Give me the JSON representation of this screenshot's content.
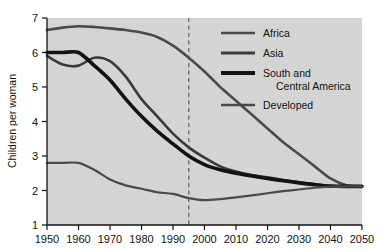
{
  "chart_data": {
    "type": "line",
    "title": "",
    "subtitle": "",
    "xlabel": "",
    "ylabel": "Children per woman",
    "xlim": [
      1950,
      2050
    ],
    "ylim": [
      1,
      7
    ],
    "xticks": [
      1950,
      1960,
      1970,
      1980,
      1990,
      2000,
      2010,
      2020,
      2030,
      2040,
      2050
    ],
    "yticks": [
      1,
      2,
      3,
      4,
      5,
      6,
      7
    ],
    "grid": false,
    "legend_position": "top-right",
    "plot_background": "#d5d5d5",
    "annotations": [
      {
        "name": "present-day-divider",
        "type": "vline",
        "x": 1995,
        "style": "dashed",
        "color": "#707070",
        "label": ""
      }
    ],
    "series": [
      {
        "name": "Africa",
        "color": "#4a4a4a",
        "line_width": 2.6,
        "x": [
          1950,
          1955,
          1960,
          1965,
          1970,
          1975,
          1980,
          1985,
          1990,
          1995,
          2000,
          2005,
          2010,
          2015,
          2020,
          2025,
          2030,
          2035,
          2040,
          2045,
          2050
        ],
        "values": [
          6.65,
          6.72,
          6.76,
          6.74,
          6.7,
          6.65,
          6.58,
          6.45,
          6.2,
          5.85,
          5.45,
          5.0,
          4.6,
          4.2,
          3.8,
          3.4,
          3.05,
          2.7,
          2.35,
          2.15,
          2.12
        ]
      },
      {
        "name": "Asia",
        "color": "#3a3a3a",
        "line_width": 2.6,
        "x": [
          1950,
          1955,
          1960,
          1965,
          1970,
          1975,
          1980,
          1985,
          1990,
          1995,
          2000,
          2005,
          2010,
          2015,
          2020,
          2025,
          2030,
          2035,
          2040,
          2045,
          2050
        ],
        "values": [
          5.9,
          5.65,
          5.62,
          5.85,
          5.75,
          5.3,
          4.65,
          4.15,
          3.65,
          3.25,
          2.95,
          2.7,
          2.55,
          2.45,
          2.38,
          2.3,
          2.24,
          2.18,
          2.13,
          2.12,
          2.12
        ]
      },
      {
        "name": "South and Central America",
        "color": "#121212",
        "line_width": 3.6,
        "x": [
          1950,
          1955,
          1960,
          1965,
          1970,
          1975,
          1980,
          1985,
          1990,
          1995,
          2000,
          2005,
          2010,
          2015,
          2020,
          2025,
          2030,
          2035,
          2040,
          2045,
          2050
        ],
        "values": [
          6.0,
          6.0,
          6.0,
          5.62,
          5.2,
          4.65,
          4.15,
          3.72,
          3.35,
          3.0,
          2.75,
          2.6,
          2.5,
          2.42,
          2.35,
          2.28,
          2.22,
          2.17,
          2.13,
          2.12,
          2.12
        ]
      },
      {
        "name": "Developed",
        "color": "#4a4a4a",
        "line_width": 2.2,
        "x": [
          1950,
          1955,
          1960,
          1965,
          1970,
          1975,
          1980,
          1985,
          1990,
          1995,
          2000,
          2005,
          2010,
          2015,
          2020,
          2025,
          2030,
          2035,
          2040,
          2045,
          2050
        ],
        "values": [
          2.8,
          2.8,
          2.8,
          2.6,
          2.32,
          2.15,
          2.05,
          1.95,
          1.9,
          1.78,
          1.72,
          1.75,
          1.8,
          1.86,
          1.92,
          1.98,
          2.03,
          2.08,
          2.11,
          2.12,
          2.12
        ]
      }
    ]
  },
  "legend": {
    "entries": [
      {
        "label": "Africa",
        "line_width": 2.6,
        "color": "#4a4a4a"
      },
      {
        "label": "Asia",
        "line_width": 3.0,
        "color": "#3a3a3a"
      },
      {
        "label": "South and",
        "label2": "Central America",
        "line_width": 4.0,
        "color": "#121212"
      },
      {
        "label": "Developed",
        "line_width": 2.4,
        "color": "#4a4a4a"
      }
    ]
  },
  "axis": {
    "y_title": "Children per woman",
    "y_tick_labels": [
      "1",
      "2",
      "3",
      "4",
      "5",
      "6",
      "7"
    ],
    "x_tick_labels": [
      "1950",
      "1960",
      "1970",
      "1980",
      "1990",
      "2000",
      "2010",
      "2020",
      "2030",
      "2040",
      "2050"
    ]
  }
}
